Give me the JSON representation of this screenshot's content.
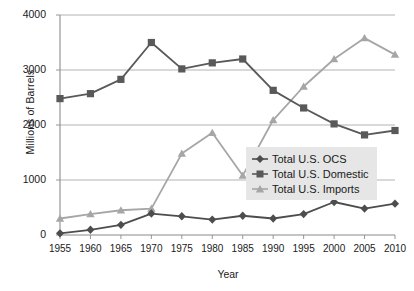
{
  "chart_data": {
    "type": "line",
    "title": "",
    "xlabel": "Year",
    "ylabel": "Millions of Barrels",
    "x": [
      1955,
      1960,
      1965,
      1970,
      1975,
      1980,
      1985,
      1990,
      1995,
      2000,
      2005,
      2010
    ],
    "xtick_labels": [
      "1955",
      "1960",
      "1965",
      "1970",
      "1975",
      "1980",
      "1985",
      "1990",
      "1995",
      "2000",
      "2005",
      "2010"
    ],
    "ytick_labels": [
      "0",
      "1000",
      "2000",
      "3000",
      "4000"
    ],
    "yticks": [
      0,
      1000,
      2000,
      3000,
      4000
    ],
    "ylim": [
      0,
      4000
    ],
    "xlim": [
      1955,
      2010
    ],
    "grid": "horizontal",
    "legend_position": "center-right",
    "series": [
      {
        "name": "Total U.S. OCS",
        "marker": "diamond",
        "color": "#4d4d4d",
        "values": [
          30,
          95,
          185,
          390,
          340,
          280,
          350,
          300,
          380,
          600,
          480,
          570
        ]
      },
      {
        "name": "Total U.S. Domestic",
        "marker": "square",
        "color": "#595959",
        "values": [
          2480,
          2570,
          2830,
          3500,
          3020,
          3130,
          3200,
          2630,
          2310,
          2020,
          1820,
          1900
        ]
      },
      {
        "name": "Total U.S. Imports",
        "marker": "triangle",
        "color": "#a6a6a6",
        "values": [
          300,
          380,
          450,
          480,
          1480,
          1860,
          1080,
          2090,
          2700,
          3200,
          3580,
          3280
        ]
      }
    ]
  },
  "legend": {
    "items": [
      {
        "label": "Total U.S. OCS"
      },
      {
        "label": "Total U.S. Domestic"
      },
      {
        "label": "Total U.S. Imports"
      }
    ]
  },
  "colors": {
    "ocs": "#4d4d4d",
    "domestic": "#595959",
    "imports": "#a6a6a6",
    "grid": "#aaaaaa",
    "axis": "#8c8c8c",
    "legend_bg": "#e6e6e6"
  }
}
